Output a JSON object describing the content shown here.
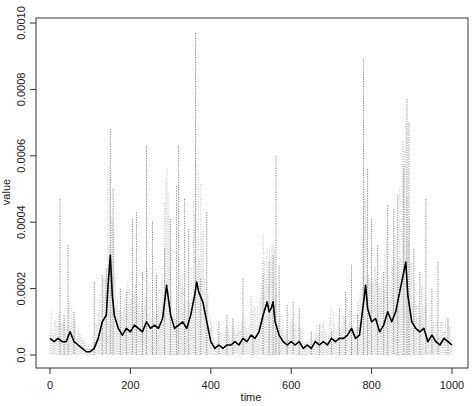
{
  "chart_data": {
    "type": "line",
    "title": "",
    "xlabel": "time",
    "ylabel": "value",
    "xlim": [
      0,
      1000
    ],
    "ylim": [
      0,
      0.001
    ],
    "x_ticks": [
      0,
      200,
      400,
      600,
      800,
      1000
    ],
    "x_tick_labels": [
      "0",
      "200",
      "400",
      "600",
      "800",
      "1000"
    ],
    "y_ticks": [
      0,
      0.0002,
      0.0004,
      0.0006,
      0.0008,
      0.001
    ],
    "y_tick_labels": [
      "0.0",
      "0.0002",
      "0.0004",
      "0.0006",
      "0.0008",
      "0.0010"
    ],
    "grid": false,
    "legend": null,
    "series": [
      {
        "name": "mean",
        "style": "solid",
        "color": "#000000",
        "x": [
          0,
          10,
          20,
          30,
          40,
          50,
          60,
          70,
          80,
          90,
          100,
          110,
          120,
          130,
          140,
          145,
          150,
          155,
          160,
          170,
          180,
          190,
          200,
          210,
          220,
          230,
          240,
          250,
          260,
          270,
          280,
          290,
          300,
          310,
          320,
          330,
          340,
          350,
          360,
          365,
          370,
          380,
          390,
          400,
          410,
          420,
          430,
          440,
          450,
          460,
          470,
          480,
          490,
          500,
          510,
          520,
          530,
          540,
          545,
          550,
          555,
          560,
          570,
          580,
          590,
          600,
          610,
          620,
          630,
          640,
          650,
          660,
          670,
          680,
          690,
          700,
          710,
          720,
          730,
          740,
          750,
          760,
          770,
          780,
          785,
          790,
          800,
          810,
          820,
          830,
          840,
          850,
          860,
          870,
          880,
          885,
          890,
          900,
          910,
          920,
          930,
          940,
          950,
          960,
          970,
          980,
          990,
          1000
        ],
        "y": [
          5e-05,
          4e-05,
          5e-05,
          4e-05,
          4e-05,
          7e-05,
          4e-05,
          3e-05,
          2e-05,
          1e-05,
          1e-05,
          2e-05,
          5e-05,
          0.0001,
          0.00012,
          0.00022,
          0.0003,
          0.00018,
          0.00012,
          8e-05,
          6e-05,
          8e-05,
          7e-05,
          9e-05,
          8e-05,
          7e-05,
          0.0001,
          8e-05,
          9e-05,
          8e-05,
          0.00011,
          0.00021,
          0.00012,
          8e-05,
          9e-05,
          0.0001,
          8e-05,
          0.00012,
          0.00018,
          0.00022,
          0.00019,
          0.00016,
          0.0001,
          4e-05,
          2e-05,
          3e-05,
          2e-05,
          3e-05,
          3e-05,
          4e-05,
          3e-05,
          5e-05,
          4e-05,
          6e-05,
          5e-05,
          7e-05,
          0.00012,
          0.00016,
          0.00013,
          0.00014,
          0.00016,
          0.0001,
          6e-05,
          4e-05,
          3e-05,
          4e-05,
          3e-05,
          4e-05,
          2e-05,
          3e-05,
          2e-05,
          4e-05,
          3e-05,
          4e-05,
          3e-05,
          5e-05,
          4e-05,
          5e-05,
          5e-05,
          6e-05,
          8e-05,
          5e-05,
          6e-05,
          0.00016,
          0.00021,
          0.00014,
          0.0001,
          0.00011,
          7e-05,
          9e-05,
          0.00013,
          0.0001,
          0.00013,
          0.00019,
          0.00025,
          0.00028,
          0.00018,
          0.0001,
          8e-05,
          7e-05,
          8e-05,
          4e-05,
          6e-05,
          4e-05,
          3e-05,
          5e-05,
          4e-05,
          3e-05
        ]
      },
      {
        "name": "samples",
        "style": "dotted",
        "color": "#555555",
        "peaks": [
          {
            "x": 25,
            "y": 0.00047
          },
          {
            "x": 35,
            "y": 0.00012
          },
          {
            "x": 45,
            "y": 0.00033
          },
          {
            "x": 60,
            "y": 0.00013
          },
          {
            "x": 110,
            "y": 0.00022
          },
          {
            "x": 130,
            "y": 0.00024
          },
          {
            "x": 140,
            "y": 0.00026
          },
          {
            "x": 150,
            "y": 0.00068
          },
          {
            "x": 157,
            "y": 0.0005
          },
          {
            "x": 175,
            "y": 0.0002
          },
          {
            "x": 190,
            "y": 0.00019
          },
          {
            "x": 205,
            "y": 0.00041
          },
          {
            "x": 215,
            "y": 0.00043
          },
          {
            "x": 230,
            "y": 0.00025
          },
          {
            "x": 240,
            "y": 0.00063
          },
          {
            "x": 255,
            "y": 0.0004
          },
          {
            "x": 265,
            "y": 0.00024
          },
          {
            "x": 285,
            "y": 0.00032
          },
          {
            "x": 300,
            "y": 0.00041
          },
          {
            "x": 315,
            "y": 0.00051
          },
          {
            "x": 320,
            "y": 0.00063
          },
          {
            "x": 335,
            "y": 0.00047
          },
          {
            "x": 345,
            "y": 0.00038
          },
          {
            "x": 362,
            "y": 0.00097
          },
          {
            "x": 375,
            "y": 0.00023
          },
          {
            "x": 390,
            "y": 0.00043
          },
          {
            "x": 420,
            "y": 0.0001
          },
          {
            "x": 440,
            "y": 0.00012
          },
          {
            "x": 455,
            "y": 0.00011
          },
          {
            "x": 480,
            "y": 0.00023
          },
          {
            "x": 505,
            "y": 6e-05
          },
          {
            "x": 530,
            "y": 0.00024
          },
          {
            "x": 545,
            "y": 0.00028
          },
          {
            "x": 555,
            "y": 0.0003
          },
          {
            "x": 562,
            "y": 0.0006
          },
          {
            "x": 570,
            "y": 0.00027
          },
          {
            "x": 590,
            "y": 0.00015
          },
          {
            "x": 605,
            "y": 0.00016
          },
          {
            "x": 620,
            "y": 0.00014
          },
          {
            "x": 650,
            "y": 7e-05
          },
          {
            "x": 670,
            "y": 9e-05
          },
          {
            "x": 700,
            "y": 7e-05
          },
          {
            "x": 720,
            "y": 0.00014
          },
          {
            "x": 735,
            "y": 0.00019
          },
          {
            "x": 750,
            "y": 0.00027
          },
          {
            "x": 765,
            "y": 0.00012
          },
          {
            "x": 780,
            "y": 0.00089
          },
          {
            "x": 790,
            "y": 0.00056
          },
          {
            "x": 800,
            "y": 0.00041
          },
          {
            "x": 815,
            "y": 0.00033
          },
          {
            "x": 830,
            "y": 0.00025
          },
          {
            "x": 840,
            "y": 0.00045
          },
          {
            "x": 855,
            "y": 0.00044
          },
          {
            "x": 865,
            "y": 0.00048
          },
          {
            "x": 880,
            "y": 0.00057
          },
          {
            "x": 888,
            "y": 0.00077
          },
          {
            "x": 893,
            "y": 0.0007
          },
          {
            "x": 905,
            "y": 0.00032
          },
          {
            "x": 920,
            "y": 0.00025
          },
          {
            "x": 935,
            "y": 0.00047
          },
          {
            "x": 950,
            "y": 0.0002
          },
          {
            "x": 965,
            "y": 0.00028
          },
          {
            "x": 990,
            "y": 0.00011
          }
        ]
      }
    ]
  }
}
